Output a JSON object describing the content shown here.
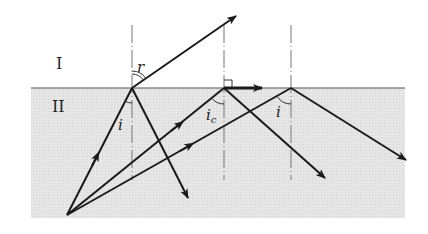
{
  "diagram": {
    "regions": [
      {
        "id": "I",
        "label": "I",
        "fill": "#ffffff"
      },
      {
        "id": "II",
        "label": "II",
        "fill": "#e6e6e6"
      }
    ],
    "angle_labels": {
      "refraction": "r",
      "incidence_1": "i",
      "critical": "i",
      "critical_subscript": "c",
      "incidence_3": "i"
    },
    "colors": {
      "ray": "#1a1a1a",
      "normal": "#666666",
      "interface": "#555555",
      "medium_II": "#e6e6e6"
    }
  }
}
